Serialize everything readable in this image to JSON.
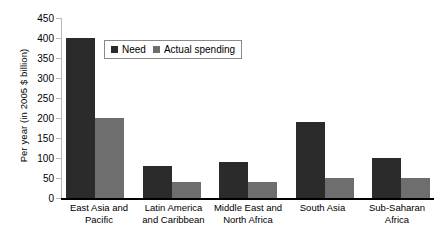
{
  "chart_data": {
    "type": "bar",
    "title": "",
    "xlabel": "",
    "ylabel": "Per year (in 2005 $ billion)",
    "ylim": [
      0,
      450
    ],
    "yticks": [
      0,
      50,
      100,
      150,
      200,
      250,
      300,
      350,
      400,
      450
    ],
    "grid": false,
    "legend_position": "top-left-inside",
    "categories": [
      "East Asia and Pacific",
      "Latin America and Caribbean",
      "Middle East and North Africa",
      "South Asia",
      "Sub-Saharan Africa"
    ],
    "series": [
      {
        "name": "Need",
        "color": "#2b2b2b",
        "values": [
          400,
          80,
          90,
          190,
          100
        ]
      },
      {
        "name": "Actual spending",
        "color": "#6e6e6e",
        "values": [
          200,
          40,
          40,
          50,
          50
        ]
      }
    ]
  },
  "category_lines": [
    [
      "East Asia and",
      "Pacific"
    ],
    [
      "Latin America",
      "and Caribbean"
    ],
    [
      "Middle East and",
      "North Africa"
    ],
    [
      "South Asia",
      ""
    ],
    [
      "Sub-Saharan",
      "Africa"
    ]
  ]
}
